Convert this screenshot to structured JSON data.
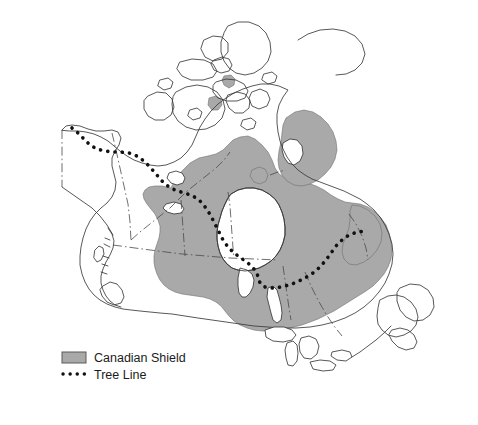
{
  "map": {
    "title": "Map of Canada",
    "region": "Canada",
    "background_color": "#ffffff",
    "shield_color": "#a9a9a9",
    "shield_outline_color": "#6e6e6e",
    "coastline_color": "#3a3a3a",
    "border_color": "#4a4a4a",
    "treeline_color": "#111111",
    "features": {
      "canadian_shield_label": "Canadian Shield",
      "tree_line_label": "Tree Line",
      "water_bodies": [
        "Hudson Bay",
        "Foxe Basin",
        "Great Bear Lake",
        "Great Slave Lake",
        "Lake Winnipeg",
        "Great Lakes"
      ],
      "islands": [
        "Baffin Island",
        "Victoria Island",
        "Ellesmere Island",
        "Banks Island",
        "Newfoundland",
        "Vancouver Island"
      ]
    }
  },
  "legend": {
    "items": [
      {
        "key": "canadian-shield",
        "label": "Canadian Shield",
        "symbol": "filled-rectangle",
        "color": "#a9a9a9"
      },
      {
        "key": "tree-line",
        "label": "Tree Line",
        "symbol": "dotted-line",
        "color": "#111111"
      }
    ]
  }
}
